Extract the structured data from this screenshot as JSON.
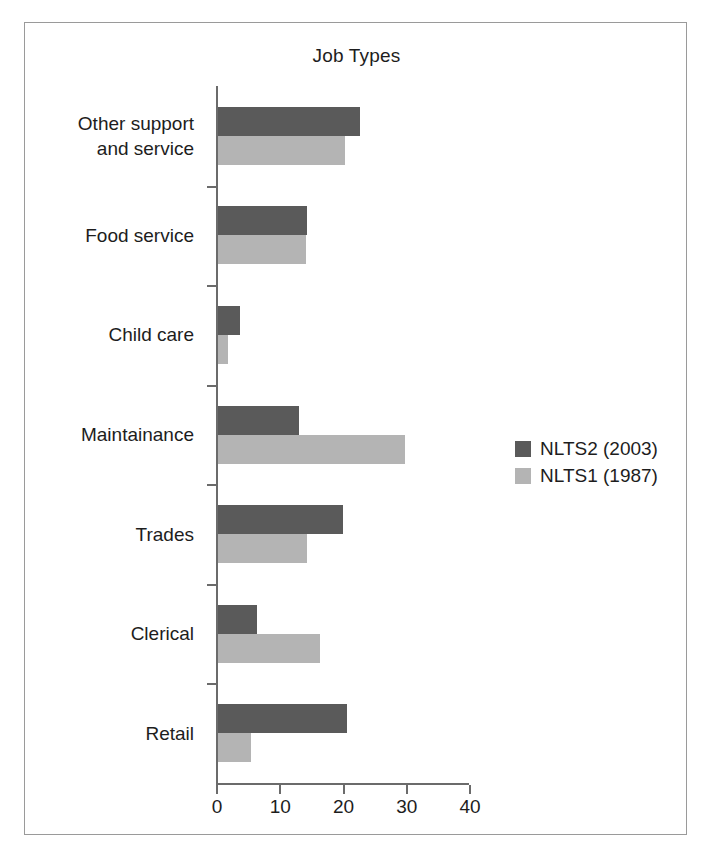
{
  "chart_data": {
    "type": "bar",
    "orientation": "horizontal",
    "title": "Job Types",
    "xlabel": "",
    "ylabel": "",
    "xlim": [
      0,
      40
    ],
    "xticks": [
      0,
      10,
      20,
      30,
      40
    ],
    "xtick_labels": [
      "0",
      "10",
      "20",
      "30",
      "40"
    ],
    "grid": false,
    "legend_position": "right-middle",
    "categories": [
      "Other support\nand service",
      "Food service",
      "Child care",
      "Maintainance",
      "Trades",
      "Clerical",
      "Retail"
    ],
    "series": [
      {
        "name": "NLTS2 (2003)",
        "color": "#5a5a5a",
        "values": [
          22.5,
          14.0,
          3.5,
          12.8,
          19.8,
          6.2,
          20.4
        ]
      },
      {
        "name": "NLTS1 (1987)",
        "color": "#b4b4b4",
        "values": [
          20.1,
          13.9,
          1.6,
          29.6,
          14.1,
          16.1,
          5.2
        ]
      }
    ]
  },
  "figure": {
    "border_color": "#9a9a9a",
    "background": "#ffffff",
    "axis_color": "#6b6b6b"
  }
}
